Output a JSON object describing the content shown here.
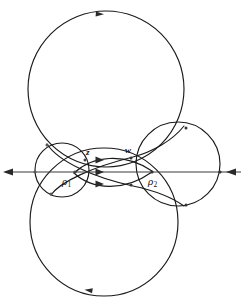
{
  "figure": {
    "background_color": "#ffffff",
    "curve_color": "#1a1a1a",
    "axis_color": "#3a3a3a",
    "width": 246,
    "height": 302,
    "labels": {
      "z": "z",
      "w": "w",
      "rho1_symbol": "ρ",
      "rho1_sub": "1",
      "rho2_symbol": "ρ",
      "rho2_sub": "2"
    },
    "axis": {
      "y": 172,
      "x_start": 3,
      "x_end": 243,
      "left_arrow_direction": "left",
      "right_arrow_direction": "left"
    },
    "circles": [
      {
        "name": "upper-large-circle",
        "cx": 106,
        "cy": 89,
        "r": 78,
        "arrow_direction": "clockwise",
        "arrow_position": "top"
      },
      {
        "name": "lower-large-circle",
        "cx": 104,
        "cy": 222,
        "r": 74,
        "arrow_direction": "clockwise",
        "arrow_position": "bottom"
      },
      {
        "name": "right-medium-circle",
        "cx": 178,
        "cy": 164,
        "r": 42
      },
      {
        "name": "left-small-circle",
        "cx": 62,
        "cy": 170,
        "r": 27
      }
    ],
    "arcs": [
      {
        "name": "upper-lens-arc",
        "from": "rho1",
        "to": "rho2",
        "bulge": "up"
      },
      {
        "name": "lower-lens-arc",
        "from": "rho1",
        "to": "rho2",
        "bulge": "down"
      }
    ],
    "flow_arrows": [
      {
        "name": "flow-arrow-upper",
        "x": 100,
        "y": 160,
        "direction": "right"
      },
      {
        "name": "flow-arrow-middle",
        "x": 100,
        "y": 172,
        "direction": "right"
      },
      {
        "name": "flow-arrow-lower",
        "x": 100,
        "y": 184,
        "direction": "right"
      }
    ],
    "nodes": [
      {
        "name": "node-rho1",
        "x": 75,
        "y": 172
      },
      {
        "name": "node-rho2",
        "x": 152,
        "y": 172
      },
      {
        "name": "node-z",
        "x": 85,
        "y": 160
      },
      {
        "name": "node-left-axis",
        "x": 35,
        "y": 172
      },
      {
        "name": "node-right-axis",
        "x": 220,
        "y": 172
      },
      {
        "name": "node-upper-left",
        "x": 47,
        "y": 145
      },
      {
        "name": "node-lower-left",
        "x": 51,
        "y": 194
      }
    ]
  }
}
